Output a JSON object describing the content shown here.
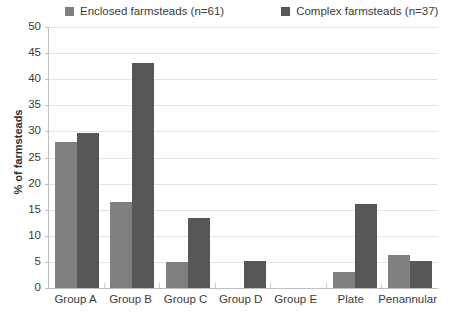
{
  "chart_data": {
    "type": "bar",
    "title": "",
    "xlabel": "",
    "ylabel": "% of farmsteads",
    "ylim": [
      0,
      50
    ],
    "yticks": [
      0,
      5,
      10,
      15,
      20,
      25,
      30,
      35,
      40,
      45,
      50
    ],
    "grid": true,
    "legend_position": "top",
    "categories": [
      "Group A",
      "Group B",
      "Group C",
      "Group D",
      "Group E",
      "Plate",
      "Penannular"
    ],
    "series": [
      {
        "name": "Enclosed farmsteads (n=61)",
        "color": "#808080",
        "values": [
          27.9,
          16.4,
          4.9,
          0,
          0,
          3.0,
          6.3
        ]
      },
      {
        "name": "Complex farmsteads (n=37)",
        "color": "#575757",
        "values": [
          29.7,
          43.2,
          13.5,
          5.1,
          0,
          16.1,
          5.2
        ]
      }
    ]
  },
  "legend": {
    "items": [
      {
        "label": "Enclosed farmsteads (n=61)",
        "color": "#808080"
      },
      {
        "label": "Complex farmsteads (n=37)",
        "color": "#575757"
      }
    ]
  },
  "axes": {
    "y_title": "% of farmsteads",
    "y_tick_labels": [
      "50",
      "45",
      "40",
      "35",
      "30",
      "25",
      "20",
      "15",
      "10",
      "5",
      "0"
    ],
    "x_tick_labels": [
      "Group A",
      "Group B",
      "Group C",
      "Group D",
      "Group E",
      "Plate",
      "Penannular"
    ]
  },
  "colors": {
    "enclosed": "#808080",
    "complex": "#575757",
    "gridline": "#e4e4e4",
    "axis": "#bfbfbf",
    "text": "#3b3b3b",
    "background": "#ffffff"
  }
}
